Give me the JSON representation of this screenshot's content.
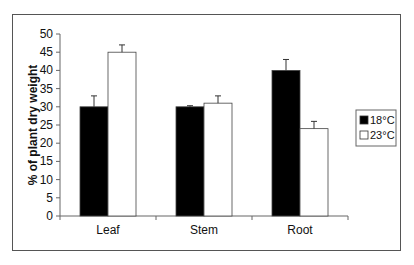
{
  "chart_data": {
    "type": "bar",
    "title": "",
    "xlabel": "",
    "ylabel": "% of plant dry weight",
    "ylim": [
      0,
      50
    ],
    "yticks": [
      0,
      5,
      10,
      15,
      20,
      25,
      30,
      35,
      40,
      45,
      50
    ],
    "grid": false,
    "legend_position": "right",
    "categories": [
      "Leaf",
      "Stem",
      "Root"
    ],
    "series": [
      {
        "name": "18°C",
        "color": "#000000",
        "values": [
          30,
          30,
          40
        ],
        "error": [
          3,
          0.3,
          3
        ]
      },
      {
        "name": "23°C",
        "color": "#ffffff",
        "values": [
          45,
          31,
          24
        ],
        "error": [
          2,
          2,
          2
        ]
      }
    ]
  }
}
